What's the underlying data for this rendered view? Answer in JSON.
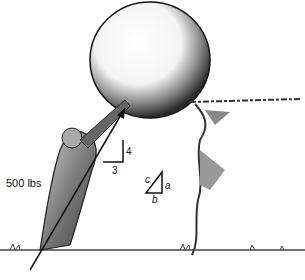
{
  "figure": {
    "force_label": "500 lbs",
    "slope_rise": "4",
    "slope_run": "3",
    "triangle": {
      "hypotenuse": "c",
      "vertical": "a",
      "horizontal": "b"
    }
  }
}
